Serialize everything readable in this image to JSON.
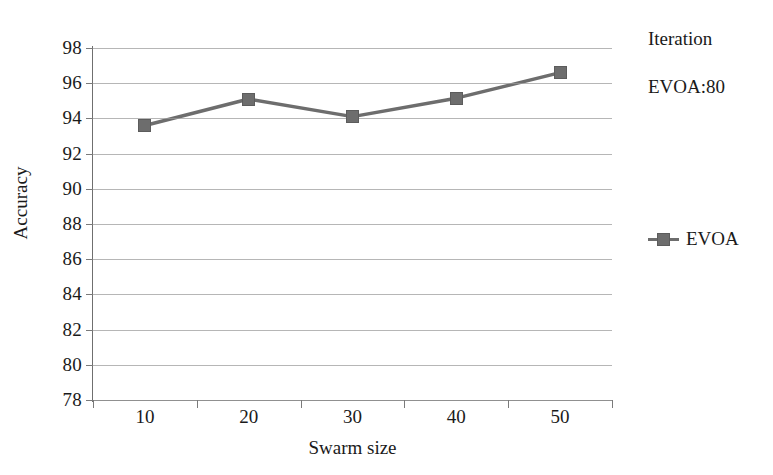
{
  "chart_data": {
    "type": "line",
    "title": "",
    "subtitle": "",
    "xlabel": "Swarm size",
    "ylabel": "Accuracy",
    "categories": [
      "10",
      "20",
      "30",
      "40",
      "50"
    ],
    "x": [
      10,
      20,
      30,
      40,
      50
    ],
    "series": [
      {
        "name": "EVOA",
        "values": [
          93.6,
          95.1,
          94.1,
          95.15,
          96.6
        ],
        "color": "#6d6d6d",
        "marker": "square"
      }
    ],
    "ylim": [
      78,
      98
    ],
    "y_ticks": [
      98,
      96,
      94,
      92,
      90,
      88,
      86,
      84,
      82,
      80,
      78
    ],
    "grid": true,
    "legend_position": "right",
    "annotations": [
      "Iteration",
      "EVOA:80"
    ]
  },
  "axes": {
    "y_title": "Accuracy",
    "x_title": "Swarm size",
    "y_tick_labels": [
      "98",
      "96",
      "94",
      "92",
      "90",
      "88",
      "86",
      "84",
      "82",
      "80",
      "78"
    ],
    "x_tick_labels": [
      "10",
      "20",
      "30",
      "40",
      "50"
    ]
  },
  "legend": {
    "panel_title": "Iteration",
    "panel_value": "EVOA:80",
    "entries": [
      {
        "label": "EVOA",
        "color": "#6d6d6d"
      }
    ]
  },
  "style": {
    "series_color": "#6d6d6d",
    "grid_color": "#9a9a9a",
    "axis_color": "#6f6f6f",
    "text_color": "#1a1a1a",
    "background": "#ffffff"
  }
}
